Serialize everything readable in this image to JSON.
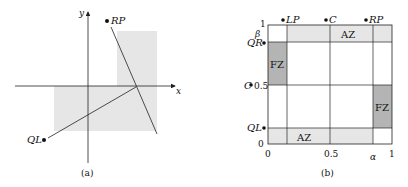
{
  "panel_a": {
    "caption": "(a)",
    "x_axis_label": "x",
    "y_axis_label": "y",
    "points": [
      {
        "name": "RP",
        "label": "RP"
      },
      {
        "name": "QL",
        "label": "QL"
      }
    ]
  },
  "panel_b": {
    "caption": "(b)",
    "x_axis_label": "α",
    "y_axis_label": "β",
    "x_ticks": [
      "0",
      "0.5",
      "1"
    ],
    "y_ticks": [
      "0",
      "0.5",
      "1"
    ],
    "top_points": [
      "LP",
      "C",
      "RP"
    ],
    "left_points": [
      "QR",
      "C",
      "QL"
    ],
    "regions": {
      "az_top": "AZ",
      "az_bottom": "AZ",
      "fz_left": "FZ",
      "fz_right": "FZ"
    }
  },
  "colors": {
    "light_shade": "#e6e6e6",
    "dark_shade": "#b4b4b4",
    "line": "#222222"
  }
}
